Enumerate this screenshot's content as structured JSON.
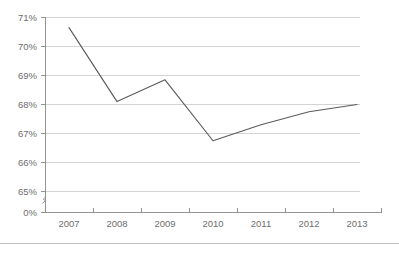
{
  "chart_data": {
    "type": "line",
    "title": "",
    "subtitle": "",
    "xlabel": "",
    "ylabel": "",
    "categories": [
      "2007",
      "2008",
      "2009",
      "2010",
      "2011",
      "2012",
      "2013"
    ],
    "x": [
      2007,
      2008,
      2009,
      2010,
      2011,
      2012,
      2013
    ],
    "values": [
      70.65,
      68.1,
      68.85,
      66.75,
      67.3,
      67.75,
      68.0
    ],
    "series": [
      {
        "name": "",
        "values": [
          70.65,
          68.1,
          68.85,
          66.75,
          67.3,
          67.75,
          68.0
        ]
      }
    ],
    "y_tick_labels": [
      "71%",
      "70%",
      "69%",
      "68%",
      "67%",
      "66%",
      "65%",
      "0%"
    ],
    "y_tick_values": [
      71,
      70,
      69,
      68,
      67,
      66,
      65,
      0
    ],
    "ylim": [
      65,
      71
    ],
    "y_axis_broken": true,
    "y_axis_break_note": "axis break between 0% and 65%",
    "grid": "horizontal",
    "legend": "none",
    "markers": "none",
    "annotations": [],
    "colors": {
      "line": "#5b5b5b",
      "grid": "#c9c9c9",
      "axis": "#8a8a8a",
      "tick_text": "#6d6d6d",
      "background": "#ffffff"
    }
  },
  "axes": {
    "y_ticks": [
      {
        "label": "71%",
        "value": 71
      },
      {
        "label": "70%",
        "value": 70
      },
      {
        "label": "69%",
        "value": 69
      },
      {
        "label": "68%",
        "value": 68
      },
      {
        "label": "67%",
        "value": 67
      },
      {
        "label": "66%",
        "value": 66
      },
      {
        "label": "65%",
        "value": 65
      },
      {
        "label": "0%",
        "value": 0
      }
    ],
    "x_ticks": [
      {
        "label": "2007"
      },
      {
        "label": "2008"
      },
      {
        "label": "2009"
      },
      {
        "label": "2010"
      },
      {
        "label": "2011"
      },
      {
        "label": "2012"
      },
      {
        "label": "2013"
      }
    ]
  }
}
